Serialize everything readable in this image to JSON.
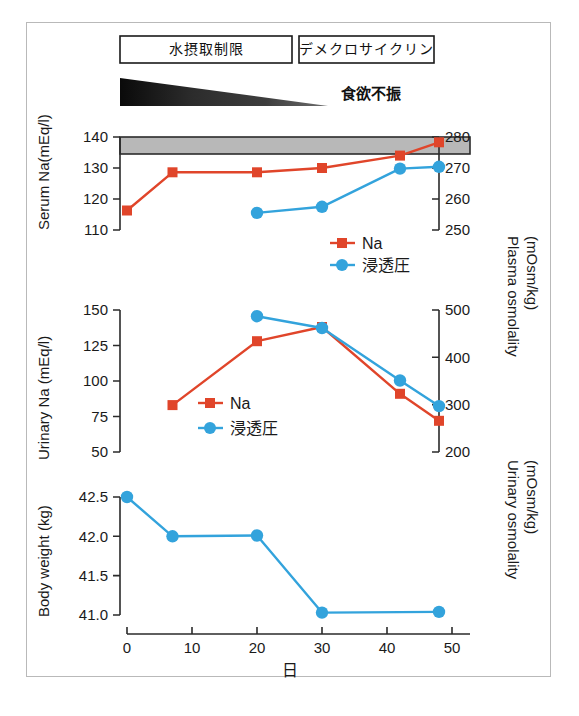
{
  "figure": {
    "treatment_boxes": [
      {
        "label": "水摂取制限"
      },
      {
        "label": "デメクロサイクリン"
      }
    ],
    "symptom_label": "食欲不振",
    "xaxis": {
      "label": "日",
      "ticks": [
        "0",
        "10",
        "20",
        "30",
        "40",
        "50"
      ],
      "min": 0,
      "max": 52
    },
    "colors": {
      "na_red": "#e0452a",
      "osm_blue": "#33a3dc",
      "band_grey": "#b8b8b8",
      "axis_black": "#2b2b2b",
      "frame_grey": "#b9b9b9"
    },
    "legend": {
      "na": "Na",
      "osm": "浸透圧"
    }
  },
  "chart_data": [
    {
      "type": "line",
      "panel": "serum",
      "title": "",
      "ylabel": "Serum Na(mEq/l)",
      "y2label": "Plasma osmolality (mOsm/kg)",
      "xlabel": "日",
      "ylim": [
        110,
        140
      ],
      "yticks": [
        "110",
        "120",
        "130",
        "140"
      ],
      "y2lim": [
        250,
        280
      ],
      "y2ticks": [
        "250",
        "260",
        "270",
        "280"
      ],
      "normal_band": {
        "from": 136.5,
        "to": 140
      },
      "series": [
        {
          "name": "Na",
          "axis": "left",
          "marker": "square",
          "color": "#e0452a",
          "x": [
            0,
            7,
            20,
            30,
            42,
            48
          ],
          "values": [
            116.3,
            128.6,
            128.6,
            130.0,
            134.0,
            138.3
          ]
        },
        {
          "name": "浸透圧",
          "axis": "right",
          "marker": "circle",
          "color": "#33a3dc",
          "x": [
            20,
            30,
            42,
            48
          ],
          "values": [
            255.5,
            257.5,
            269.8,
            270.4
          ]
        }
      ]
    },
    {
      "type": "line",
      "panel": "urinary",
      "title": "",
      "ylabel": "Urinary Na (mEq/l)",
      "y2label": "Urinary osmolality (mOsm/kg)",
      "xlabel": "日",
      "ylim": [
        50,
        150
      ],
      "yticks": [
        "50",
        "75",
        "100",
        "125",
        "150"
      ],
      "y2lim": [
        200,
        500
      ],
      "y2ticks": [
        "200",
        "300",
        "400",
        "500"
      ],
      "series": [
        {
          "name": "Na",
          "axis": "left",
          "marker": "square",
          "color": "#e0452a",
          "x": [
            7,
            20,
            30,
            42,
            48
          ],
          "values": [
            83,
            128,
            138,
            91,
            72
          ]
        },
        {
          "name": "浸透圧",
          "axis": "right",
          "marker": "circle",
          "color": "#33a3dc",
          "x": [
            20,
            30,
            42,
            48
          ],
          "values": [
            487,
            462,
            351,
            297
          ]
        }
      ]
    },
    {
      "type": "line",
      "panel": "weight",
      "title": "",
      "ylabel": "Body weight (kg)",
      "xlabel": "日",
      "ylim": [
        40.8,
        42.7
      ],
      "yticks": [
        "41.0",
        "41.5",
        "42.0",
        "42.5"
      ],
      "series": [
        {
          "name": "Body weight",
          "axis": "left",
          "marker": "circle",
          "color": "#33a3dc",
          "x": [
            0,
            7,
            20,
            30,
            48
          ],
          "values": [
            42.5,
            42.0,
            42.01,
            41.03,
            41.04
          ]
        }
      ]
    }
  ]
}
